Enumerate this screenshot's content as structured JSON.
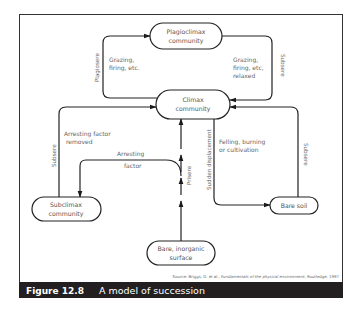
{
  "nodes": {
    "plagioclimax": [
      "Plagioclimax",
      "community"
    ],
    "climax": [
      "Climax",
      "community"
    ],
    "subclimax": [
      "Subclimax",
      "community"
    ],
    "bare_soil": [
      "Bare soil"
    ],
    "bare_inorganic": [
      "Bare, inorganic",
      "surface"
    ]
  },
  "labels": {
    "plagiosere": "Plagiosere",
    "grazing_left": [
      "Grazing,",
      "firing, etc."
    ],
    "grazing_right": [
      "Grazing,",
      "firing, etc,",
      "relaxed"
    ],
    "subsere_top_right": "Subsere",
    "subsere_left": "Subsere",
    "arresting_removed": [
      "Arresting factor",
      "removed"
    ],
    "arresting": [
      "Arresting",
      "factor"
    ],
    "prisere": "Prisere",
    "sudden_displacement": "Sudden displacement",
    "felling": [
      "Felling, burning",
      "or cultivation"
    ],
    "subsere_right": "Subsere"
  },
  "source": {
    "prefix": "Source: Briggs, D. et al., ",
    "title": "Fundamentals of the physical environment",
    "suffix": ", Routledge, 1997"
  },
  "caption": {
    "number": "Figure 12.8",
    "title": "A model of succession",
    "bar_color": "#231f20"
  }
}
